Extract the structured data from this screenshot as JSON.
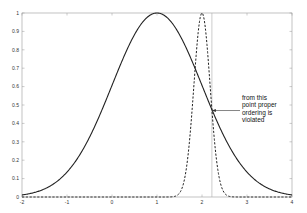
{
  "chart_data": {
    "type": "line",
    "title": "",
    "xlabel": "",
    "ylabel": "",
    "xlim": [
      -2,
      4
    ],
    "ylim": [
      0,
      1
    ],
    "grid": false,
    "legend": null,
    "x_ticks": [
      "-2",
      "-1",
      "0",
      "1",
      "2",
      "3",
      "4"
    ],
    "y_ticks": [
      "0",
      "0.1",
      "0.2",
      "0.3",
      "0.4",
      "0.5",
      "0.6",
      "0.7",
      "0.8",
      "0.9",
      "1"
    ],
    "series": [
      {
        "name": "wide gaussian",
        "style": "solid",
        "color": "#222222",
        "mean": 1,
        "sigma": 1,
        "peak": 1,
        "x": [
          -2,
          -1.5,
          -1,
          -0.5,
          0,
          0.5,
          1,
          1.5,
          2,
          2.5,
          3,
          3.5,
          4
        ],
        "values": [
          0.011,
          0.044,
          0.135,
          0.325,
          0.607,
          0.882,
          1.0,
          0.882,
          0.607,
          0.325,
          0.135,
          0.044,
          0.011
        ]
      },
      {
        "name": "narrow gaussian",
        "style": "dashed",
        "color": "#222222",
        "mean": 2,
        "sigma": 0.18,
        "peak": 1,
        "x": [
          -2,
          1.4,
          1.6,
          1.8,
          1.9,
          2.0,
          2.1,
          2.2,
          2.4,
          2.6,
          4
        ],
        "values": [
          0,
          0.004,
          0.085,
          0.54,
          0.857,
          1.0,
          0.857,
          0.54,
          0.085,
          0.004,
          0
        ]
      }
    ],
    "vertical_line": {
      "x": 2.22,
      "color": "#aaaaaa"
    },
    "annotations": [
      {
        "text_lines": [
          "from this",
          "point proper",
          "ordering is",
          "violated"
        ],
        "arrow_to": {
          "x": 2.22,
          "y": 0.47
        }
      }
    ]
  }
}
